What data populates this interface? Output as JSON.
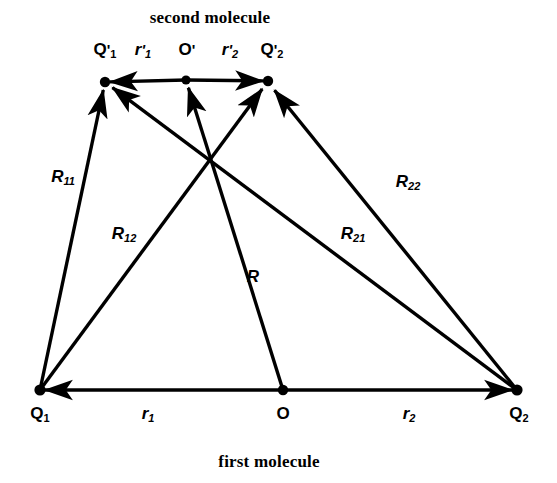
{
  "figure": {
    "title_top": "second molecule",
    "title_bottom": "first molecule",
    "line_color": "#000000",
    "background_color": "#ffffff",
    "width": 557,
    "height": 483
  },
  "nodes": [
    {
      "id": "Qp1",
      "label_base": "Q",
      "label_prime": "'",
      "label_sub": "1",
      "x": 105,
      "y": 82,
      "label_x": 105,
      "label_y": 41
    },
    {
      "id": "Op",
      "label_base": "O",
      "label_prime": "'",
      "label_sub": "",
      "x": 186,
      "y": 80,
      "label_x": 187,
      "label_y": 41
    },
    {
      "id": "Qp2",
      "label_base": "Q",
      "label_prime": "'",
      "label_sub": "2",
      "x": 268,
      "y": 81,
      "label_x": 272,
      "label_y": 41
    },
    {
      "id": "Q1",
      "label_base": "Q",
      "label_prime": "",
      "label_sub": "1",
      "x": 40,
      "y": 390,
      "label_x": 40,
      "label_y": 405
    },
    {
      "id": "O",
      "label_base": "O",
      "label_prime": "",
      "label_sub": "",
      "x": 283,
      "y": 390,
      "label_x": 283,
      "label_y": 405
    },
    {
      "id": "Q2",
      "label_base": "Q",
      "label_prime": "",
      "label_sub": "2",
      "x": 517,
      "y": 390,
      "label_x": 519,
      "label_y": 405
    }
  ],
  "vectors": [
    {
      "id": "rp1",
      "from": "Op",
      "to": "Qp1",
      "label_base": "r",
      "label_prime": "'",
      "label_sub": "1",
      "label_x": 143,
      "label_y": 41
    },
    {
      "id": "rp2",
      "from": "Op",
      "to": "Qp2",
      "label_base": "r",
      "label_prime": "'",
      "label_sub": "2",
      "label_x": 230,
      "label_y": 41
    },
    {
      "id": "r1",
      "from": "O",
      "to": "Q1",
      "label_base": "r",
      "label_prime": "",
      "label_sub": "1",
      "label_x": 148,
      "label_y": 405
    },
    {
      "id": "r2",
      "from": "O",
      "to": "Q2",
      "label_base": "r",
      "label_prime": "",
      "label_sub": "2",
      "label_x": 409,
      "label_y": 405
    },
    {
      "id": "R11",
      "from": "Q1",
      "to": "Qp1",
      "label_base": "R",
      "label_prime": "",
      "label_sub": "11",
      "label_x": 63,
      "label_y": 168
    },
    {
      "id": "R12",
      "from": "Q1",
      "to": "Qp2",
      "label_base": "R",
      "label_prime": "",
      "label_sub": "12",
      "label_x": 124,
      "label_y": 225
    },
    {
      "id": "R21",
      "from": "Q2",
      "to": "Qp1",
      "label_base": "R",
      "label_prime": "",
      "label_sub": "21",
      "label_x": 353,
      "label_y": 225
    },
    {
      "id": "R22",
      "from": "Q2",
      "to": "Qp2",
      "label_base": "R",
      "label_prime": "",
      "label_sub": "22",
      "label_x": 408,
      "label_y": 173
    },
    {
      "id": "R",
      "from": "O",
      "to": "Op",
      "label_base": "R",
      "label_prime": "",
      "label_sub": "",
      "label_x": 253,
      "label_y": 268
    }
  ],
  "captions": [
    {
      "id": "top",
      "text": "second molecule",
      "x": 210,
      "y": 8
    },
    {
      "id": "bottom",
      "text": "first molecule",
      "x": 269,
      "y": 452
    }
  ]
}
